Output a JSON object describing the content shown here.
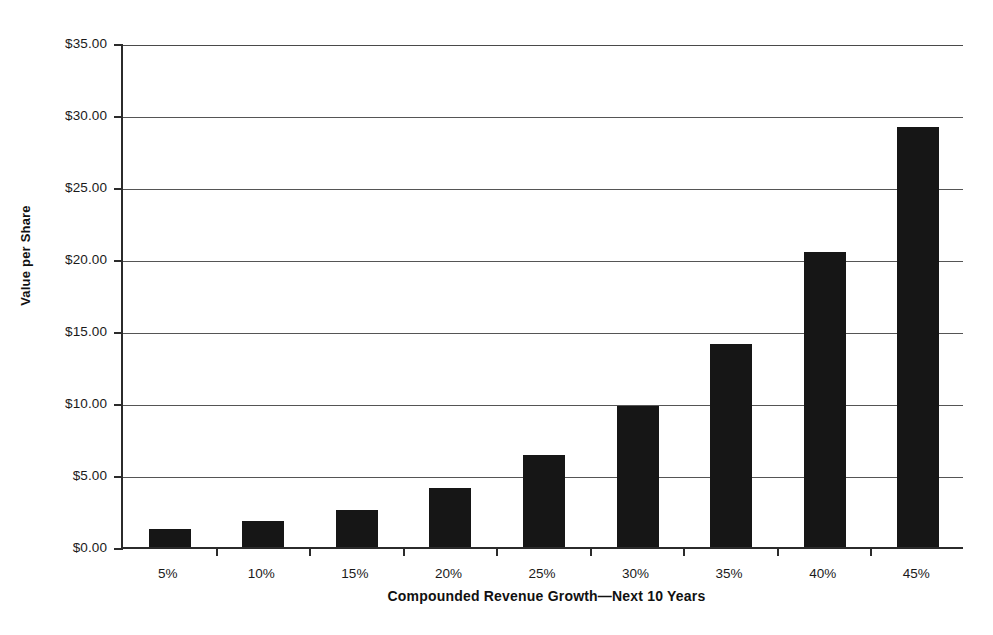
{
  "chart_data": {
    "type": "bar",
    "title": "",
    "xlabel": "Compounded Revenue Growth—Next 10 Years",
    "ylabel": "Value per Share",
    "categories": [
      "5%",
      "10%",
      "15%",
      "20%",
      "25%",
      "30%",
      "35%",
      "40%",
      "45%"
    ],
    "values": [
      1.25,
      1.8,
      2.6,
      4.1,
      6.4,
      9.8,
      14.1,
      20.5,
      29.2
    ],
    "ylim": [
      0,
      35
    ],
    "ytick_values": [
      0,
      5,
      10,
      15,
      20,
      25,
      30,
      35
    ],
    "ytick_labels": [
      "$0.00",
      "$5.00",
      "$10.00",
      "$15.00",
      "$20.00",
      "$25.00",
      "$30.00",
      "$35.00"
    ],
    "grid": true,
    "legend": false,
    "bar_color": "#161616",
    "axis_color": "#2b2b2b",
    "gridline_color": "#555555",
    "background_color": "#ffffff"
  }
}
